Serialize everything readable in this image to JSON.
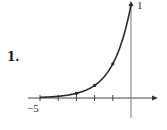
{
  "problem_number": "1.",
  "chart_data": {
    "type": "line",
    "title": "",
    "function": "y = e^x",
    "xlabel": "",
    "ylabel": "",
    "xlim": [
      -5,
      0.8
    ],
    "ylim": [
      0,
      1
    ],
    "tick_labels": {
      "x_min": "−5",
      "y_max": "1"
    },
    "x_ticks": [
      -5,
      -4,
      -3,
      -2,
      -1
    ],
    "series": [
      {
        "name": "e^x",
        "x": [
          -5,
          -4.5,
          -4,
          -3.5,
          -3,
          -2.5,
          -2,
          -1.5,
          -1,
          -0.5,
          0
        ],
        "values": [
          0.007,
          0.011,
          0.018,
          0.03,
          0.05,
          0.082,
          0.135,
          0.223,
          0.368,
          0.607,
          1.0
        ]
      }
    ],
    "marked_points": [
      {
        "x": -3,
        "y": 0.05
      },
      {
        "x": -2,
        "y": 0.135
      },
      {
        "x": -1,
        "y": 0.368
      },
      {
        "x": 0,
        "y": 1.0
      }
    ],
    "grid": false,
    "legend": "none",
    "color": "#2a2a2a"
  }
}
